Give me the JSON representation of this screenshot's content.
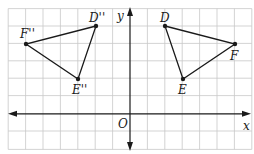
{
  "diagram": {
    "type": "coordinate-plane-reflection",
    "grid": {
      "x_min": -7,
      "x_max": 7,
      "y_min": -2,
      "y_max": 6,
      "cell_px": 17.4,
      "origin_px": [
        131,
        114
      ]
    },
    "axes": {
      "x_label": "x",
      "y_label": "y",
      "origin_label": "O"
    },
    "triangles": [
      {
        "name": "DEF",
        "vertices": [
          {
            "label": "D",
            "x": 2,
            "y": 5
          },
          {
            "label": "F",
            "x": 6,
            "y": 4
          },
          {
            "label": "E",
            "x": 3,
            "y": 2
          }
        ]
      },
      {
        "name": "D''E''F''",
        "vertices": [
          {
            "label": "D''",
            "x": -2,
            "y": 5
          },
          {
            "label": "F''",
            "x": -6,
            "y": 4
          },
          {
            "label": "E''",
            "x": -3,
            "y": 2
          }
        ]
      }
    ],
    "colors": {
      "grid": "#c8c8c8",
      "ink": "#1a1a1a",
      "background": "#ffffff"
    }
  }
}
